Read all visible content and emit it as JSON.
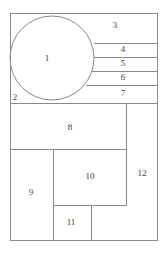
{
  "diagram": {
    "regions": [
      {
        "id": "1",
        "label": "1",
        "x": 47,
        "y": 59
      },
      {
        "id": "2",
        "label": "2",
        "x": 15,
        "y": 98
      },
      {
        "id": "3",
        "label": "3",
        "x": 115,
        "y": 26
      },
      {
        "id": "4",
        "label": "4",
        "x": 123,
        "y": 49
      },
      {
        "id": "5",
        "label": "5",
        "x": 123,
        "y": 63
      },
      {
        "id": "6",
        "label": "6",
        "x": 123,
        "y": 77
      },
      {
        "id": "7",
        "label": "7",
        "x": 123,
        "y": 93
      },
      {
        "id": "8",
        "label": "8",
        "x": 70,
        "y": 128
      },
      {
        "id": "9",
        "label": "9",
        "x": 31,
        "y": 192
      },
      {
        "id": "10",
        "label": "10",
        "x": 90,
        "y": 177
      },
      {
        "id": "11",
        "label": "11",
        "x": 71,
        "y": 223
      },
      {
        "id": "12",
        "label": "12",
        "x": 142,
        "y": 173
      }
    ],
    "stroke_color": "#8a8a8a",
    "text_color": "#444444"
  }
}
